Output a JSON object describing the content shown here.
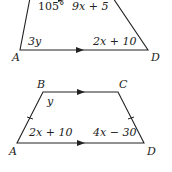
{
  "figure1": {
    "angle_label": "105°",
    "top_side": "9x + 5",
    "angle_a": "3y",
    "bottom_side": "2x + 10",
    "vertex_a": "A",
    "vertex_d": "D"
  },
  "figure2": {
    "vertex_a": "A",
    "vertex_b": "B",
    "vertex_c": "C",
    "vertex_d": "D",
    "angle_b": "y",
    "angle_a": "2x + 10",
    "angle_d": "4x − 30"
  }
}
